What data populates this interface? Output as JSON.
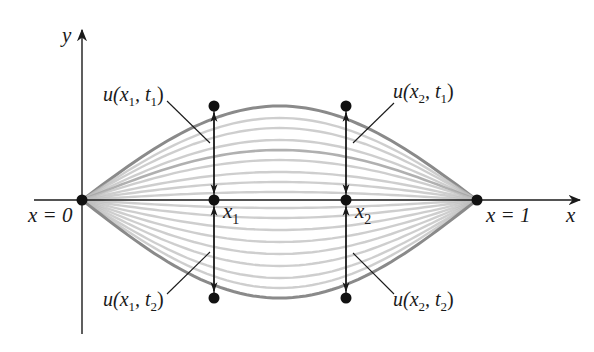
{
  "figure": {
    "axes": {
      "x_label": "x",
      "y_label": "y"
    },
    "endpoints": {
      "left_label": "x = 0",
      "right_label": "x = 1"
    },
    "points": {
      "x1_label": "x",
      "x1_sub": "1",
      "x2_label": "x",
      "x2_sub": "2"
    },
    "annotations": {
      "u_x1_t1": {
        "u": "u(x",
        "s1": "1",
        "mid": ", t",
        "s2": "1",
        "end": ")"
      },
      "u_x2_t1": {
        "u": "u(x",
        "s1": "2",
        "mid": ", t",
        "s2": "1",
        "end": ")"
      },
      "u_x1_t2": {
        "u": "u(x",
        "s1": "1",
        "mid": ", t",
        "s2": "2",
        "end": ")"
      },
      "u_x2_t2": {
        "u": "u(x",
        "s1": "2",
        "mid": ", t",
        "s2": "2",
        "end": ")"
      }
    },
    "curves": {
      "amplitudes_px": [
        94,
        82,
        72,
        60,
        50,
        40,
        28,
        18,
        8,
        -8,
        -18,
        -30,
        -42,
        -54,
        -66,
        -78,
        -88,
        -98
      ],
      "emphasized_amplitudes_px": [
        94,
        50,
        -40,
        -98
      ],
      "colors": {
        "faint": "#bdbdbd",
        "emphasized": "#8a8a8a",
        "axis": "#1a1a1a"
      }
    }
  }
}
